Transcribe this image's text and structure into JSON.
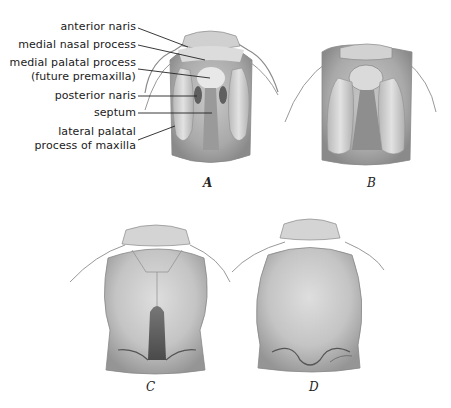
{
  "labels": [
    {
      "id": "anterior_naris",
      "text": "anterior naris"
    },
    {
      "id": "medial_nasal_process",
      "text": "medial nasal process"
    },
    {
      "id": "medial_palatal_process_1",
      "text": "medial palatal process"
    },
    {
      "id": "medial_palatal_process_2",
      "text": "(future premaxilla)"
    },
    {
      "id": "posterior_naris",
      "text": "posterior naris"
    },
    {
      "id": "septum",
      "text": "septum"
    },
    {
      "id": "lateral_palatal_1",
      "text": "lateral palatal"
    },
    {
      "id": "lateral_palatal_2",
      "text": "process of maxilla"
    }
  ],
  "captions": {
    "a": "A",
    "b": "B",
    "c": "C",
    "d": "D"
  },
  "colors": {
    "background": "#ffffff",
    "shade_dark": "#6e6e6e",
    "shade_mid": "#a8a8a8",
    "shade_light": "#dcdcdc",
    "text": "#1a1a1a"
  }
}
